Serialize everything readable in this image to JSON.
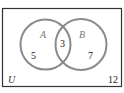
{
  "diagram": {
    "type": "venn",
    "universe_label": "U",
    "sets": [
      {
        "label": "A",
        "only_count": "5"
      },
      {
        "label": "B",
        "only_count": "7"
      }
    ],
    "intersection_count": "3",
    "outside_count": "12",
    "colors": {
      "circle": "#8a8a8a",
      "border": "#333333"
    }
  }
}
